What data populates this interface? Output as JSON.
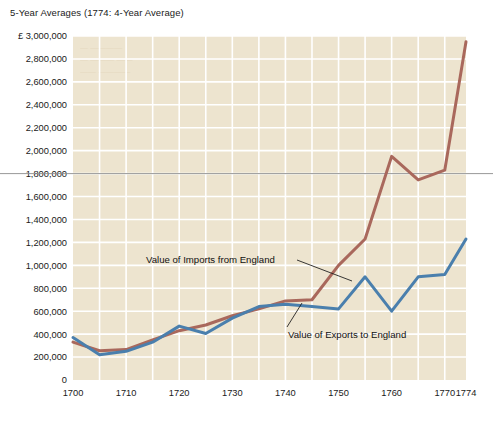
{
  "chart_data": {
    "type": "line",
    "title": "5-Year Averages (1774: 4-Year Average)",
    "xlabel": "",
    "ylabel": "",
    "currency_symbol": "£",
    "xlim": [
      1700,
      1774
    ],
    "ylim": [
      0,
      3000000
    ],
    "grid": true,
    "legend_position": "inline-annotations",
    "xticks": [
      1700,
      1710,
      1720,
      1730,
      1740,
      1750,
      1760,
      1770,
      1774
    ],
    "xtick_labels": [
      "1700",
      "1710",
      "1720",
      "1730",
      "1740",
      "1750",
      "1760",
      "1770",
      "1774"
    ],
    "yticks": [
      0,
      200000,
      400000,
      600000,
      800000,
      1000000,
      1200000,
      1400000,
      1600000,
      1800000,
      2000000,
      2200000,
      2400000,
      2600000,
      2800000,
      3000000
    ],
    "ytick_labels": [
      "0",
      "200,000",
      "400,000",
      "600,000",
      "800,000",
      "1,000,000",
      "1,200,000",
      "1,400,000",
      "1,600,000",
      "1,800,000",
      "2,000,000",
      "2,200,000",
      "2,400,000",
      "2,600,000",
      "2,800,000",
      "£ 3,000,000"
    ],
    "x": [
      1700,
      1705,
      1710,
      1715,
      1720,
      1725,
      1730,
      1735,
      1740,
      1745,
      1750,
      1755,
      1760,
      1765,
      1770,
      1774
    ],
    "series": [
      {
        "name": "Value of Imports from England",
        "color": "#a9685c",
        "values": [
          330000,
          255000,
          265000,
          350000,
          430000,
          480000,
          560000,
          620000,
          690000,
          700000,
          1000000,
          1230000,
          1950000,
          1745000,
          1830000,
          2950000
        ]
      },
      {
        "name": "Value of Exports to England",
        "color": "#4a7fad",
        "values": [
          370000,
          220000,
          250000,
          330000,
          470000,
          405000,
          540000,
          640000,
          660000,
          640000,
          620000,
          900000,
          600000,
          900000,
          920000,
          1230000
        ]
      }
    ],
    "annotations": [
      {
        "text": "Value of Imports from England",
        "series": "Value of Imports from England"
      },
      {
        "text": "Value of Exports to England",
        "series": "Value of Exports to England"
      }
    ],
    "reference_line": {
      "value": 1800000,
      "color": "#8c8c8c"
    },
    "colors": {
      "plot_background": "#ede4cf",
      "gridline": "#ffffff",
      "page_background": "#ffffff",
      "text": "#1a1a1a"
    }
  }
}
